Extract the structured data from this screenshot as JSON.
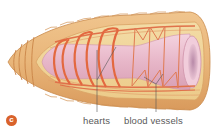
{
  "figure": {
    "panel_label": "c",
    "labels": [
      {
        "id": "hearts",
        "text": "hearts"
      },
      {
        "id": "blood-vessels",
        "text": "blood vessels"
      }
    ]
  },
  "colors": {
    "badge": "#d9622b",
    "body_outer": "#e8b57a",
    "body_ridge": "#d99a5c",
    "body_inner": "#f2dba0",
    "gut": "#e8b9cc",
    "gut_highlight": "#f5d9e3",
    "vessels": "#e0714a",
    "leader_lines": "#555555",
    "label_text": "#5a5a5a"
  }
}
